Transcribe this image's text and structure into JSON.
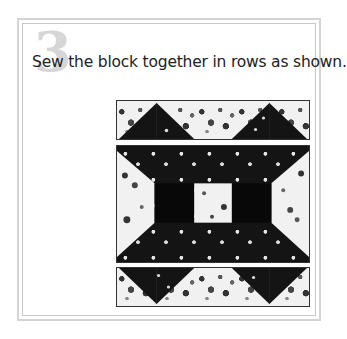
{
  "step": {
    "number": "3",
    "instruction": "Sew the block together in rows as shown."
  },
  "illustration": {
    "name": "quilt-block-rows",
    "rows": [
      {
        "id": "top-row",
        "pieces": [
          "flying-geese-left",
          "floral-center",
          "flying-geese-right"
        ]
      },
      {
        "id": "middle-row",
        "pieces": [
          "side-trapezoid-left",
          "dark-border",
          "center-floral-square",
          "dark-border",
          "side-trapezoid-right"
        ]
      },
      {
        "id": "bottom-row",
        "pieces": [
          "flying-geese-inverted-left",
          "floral-center",
          "flying-geese-inverted-right"
        ]
      }
    ],
    "colors": {
      "dark_fabric": "#141414",
      "light_fabric": "#f1f1f1",
      "outline": "#333333"
    }
  }
}
